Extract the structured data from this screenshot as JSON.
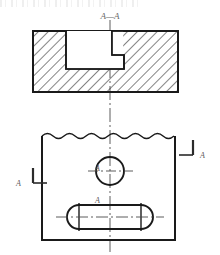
{
  "drawing": {
    "title": "A—A",
    "section_letter": "A",
    "colors": {
      "line": "#1a1a1a",
      "thin_line": "#2b2b2b",
      "hatch": "#1f1f1f",
      "center_line": "#4a4a4a",
      "label": "#4a4a4a",
      "background": "#ffffff"
    },
    "section_view": {
      "name": "section-a-a",
      "title": "A—A",
      "outline": {
        "x": 33,
        "y": 31,
        "width": 145,
        "height": 61
      },
      "hatch_angle_deg": 45,
      "hatch_spacing": 7,
      "notch": {
        "name": "stepped-notch",
        "wide_x": 66,
        "wide_y": 31,
        "wide_width": 46,
        "wide_height": 38,
        "step_x": 112,
        "step_y": 31,
        "step_width": 12,
        "step_height": 24
      }
    },
    "plan_view": {
      "name": "plan-view",
      "outline": {
        "x": 42,
        "y": 133,
        "width": 133,
        "height": 107
      },
      "break_line": {
        "name": "wavy-break-line",
        "y": 136,
        "amplitude": 3,
        "period": 22
      },
      "circle": {
        "name": "hole-circle",
        "cx": 110,
        "cy": 171,
        "r": 14
      },
      "slot": {
        "name": "obround-slot",
        "x": 67,
        "y": 205,
        "width": 86,
        "height": 24,
        "radius": 12
      }
    },
    "center_lines": {
      "vertical": {
        "name": "vertical-centerline",
        "x": 110,
        "y1": 20,
        "y2": 252
      },
      "circle_horizontal": {
        "name": "circle-centerline-h",
        "y": 171,
        "x1": 88,
        "x2": 133
      },
      "slot_horizontal": {
        "name": "slot-centerline-h",
        "y": 217,
        "x1": 56,
        "x2": 164
      }
    },
    "section_arrows": [
      {
        "name": "section-arrow-left",
        "label": "A",
        "label_x": 16,
        "label_y": 183,
        "tick_x": 33,
        "tick_y1": 168,
        "tick_y2": 183,
        "lead_x2": 47,
        "lead_y": 183,
        "side": "left"
      },
      {
        "name": "section-arrow-right",
        "label": "A",
        "label_x": 204,
        "label_y": 155,
        "tick_x": 193,
        "tick_y1": 140,
        "tick_y2": 155,
        "lead_x2": 179,
        "lead_y": 155,
        "side": "right"
      }
    ],
    "annotations": [
      {
        "name": "circle-center-label",
        "text": "A",
        "x": 103,
        "y": 168
      },
      {
        "name": "slot-upper-label",
        "text": "A",
        "x": 103,
        "y": 200
      }
    ]
  }
}
